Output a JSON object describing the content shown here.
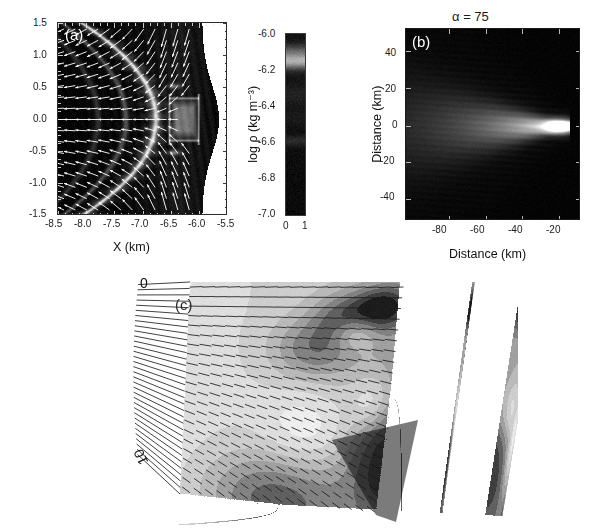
{
  "figure": {
    "background": "#ffffff",
    "panel_count": 3
  },
  "panel_a": {
    "id_label": "(a)",
    "xlabel": "X (km)",
    "x_ticks": [
      "-8.5",
      "-8.0",
      "-7.5",
      "-7.0",
      "-6.5",
      "-6.0",
      "-5.5"
    ],
    "y_ticks": [
      "1.5",
      "1.0",
      "0.5",
      "0.0",
      "-0.5",
      "-1.0",
      "-1.5"
    ],
    "xlim": [
      -8.5,
      -5.5
    ],
    "ylim": [
      -1.5,
      1.5
    ],
    "plot_type": "grayscale density map with velocity vector arrows",
    "arrow_color": "#ffffff",
    "background_color": "#000000"
  },
  "colorbar": {
    "label": "log ρ (kg m⁻³)",
    "ticks": [
      "-6.0",
      "-6.2",
      "-6.4",
      "-6.6",
      "-6.8",
      "-7.0"
    ],
    "range": [
      -7.0,
      -6.0
    ],
    "bottom_ticks": [
      "0",
      "1"
    ],
    "orientation": "vertical",
    "colormap": "grayscale"
  },
  "panel_b": {
    "id_label": "(b)",
    "title": "α = 75",
    "xlabel": "Distance (km)",
    "ylabel": "Distance (km)",
    "x_ticks": [
      "-80",
      "-60",
      "-40",
      "-20"
    ],
    "y_ticks": [
      "40",
      "20",
      "0",
      "-20",
      "-40"
    ],
    "xlim": [
      -95,
      -5
    ],
    "ylim": [
      -50,
      50
    ],
    "plot_type": "grayscale intensity map, cometary tail plume",
    "background_color": "#000000"
  },
  "panel_c": {
    "id_label": "(c)",
    "axis_labels": [
      "0",
      "10"
    ],
    "plot_type": "skewed perspective filled-contour map with overlaid hatch ticks",
    "contour_levels": 9,
    "hatch_color": "#202020"
  },
  "chart_data": {
    "type": "heatmap",
    "panels": [
      {
        "id": "(a)",
        "type": "heatmap",
        "xlabel": "X (km)",
        "ylabel": "",
        "xlim": [
          -8.5,
          -5.5
        ],
        "ylim": [
          -1.5,
          1.5
        ],
        "xticks": [
          -8.5,
          -8.0,
          -7.5,
          -7.0,
          -6.5,
          -6.0,
          -5.5
        ],
        "yticks": [
          1.5,
          1.0,
          0.5,
          0.0,
          -0.5,
          -1.0,
          -1.5
        ],
        "colorbar": {
          "label": "log ρ (kg m⁻³)",
          "ticks": [
            -6.0,
            -6.2,
            -6.4,
            -6.6,
            -6.8,
            -7.0
          ],
          "range": [
            -7.0,
            -6.0
          ]
        },
        "overlay": "white velocity vectors pointing left (outflow)",
        "grid": false
      },
      {
        "id": "(b)",
        "type": "heatmap",
        "title": "α = 75",
        "xlabel": "Distance (km)",
        "ylabel": "Distance (km)",
        "xlim": [
          -95,
          -5
        ],
        "ylim": [
          -50,
          50
        ],
        "xticks": [
          -80,
          -60,
          -40,
          -20
        ],
        "yticks": [
          -40,
          -20,
          0,
          20,
          40
        ],
        "grid": false,
        "feature": "bright compact head near x=-12, y=0 with tail extending to x=-95"
      },
      {
        "id": "(c)",
        "type": "heatmap",
        "xlabel": "",
        "ylabel": "",
        "xticks": [
          0,
          10
        ],
        "tick_labels": [
          "0",
          "10"
        ],
        "grid": false,
        "feature": "filled contour bands in a sheared quadrilateral with hatch-tick overlay"
      }
    ]
  }
}
